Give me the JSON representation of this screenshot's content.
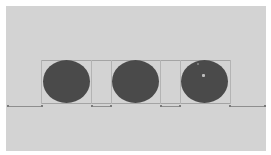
{
  "canvas": {
    "width": 271,
    "height": 155,
    "background": "#d3d3d3",
    "border_color": "#ffffff"
  },
  "shapes": {
    "circles": [
      {
        "id": "circle-1",
        "fill": "#4a4a4a"
      },
      {
        "id": "circle-2",
        "fill": "#4a4a4a"
      },
      {
        "id": "circle-3",
        "fill": "#4a4a4a",
        "selected_handle": true
      }
    ],
    "count": 3
  },
  "guides": {
    "color": "#a4a4a4",
    "baseline_color": "#8e8e8e"
  }
}
